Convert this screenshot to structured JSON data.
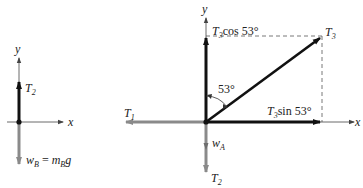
{
  "left_diagram": {
    "axis_x": "x",
    "axis_y": "y",
    "force_up": {
      "symbol": "T",
      "sub": "2"
    },
    "force_down": {
      "lhs": "w",
      "lhs_sub": "B",
      "eq": " = ",
      "rhs": "m",
      "rhs_sub": "B",
      "rhs_tail": "g"
    }
  },
  "right_diagram": {
    "axis_x": "x",
    "axis_y": "y",
    "angle_label": "53°",
    "t3": {
      "symbol": "T",
      "sub": "3"
    },
    "t1": {
      "symbol": "T",
      "sub": "1"
    },
    "t2": {
      "symbol": "T",
      "sub": "2"
    },
    "wa": {
      "symbol": "w",
      "sub": "A"
    },
    "t3_cos": {
      "symbol": "T",
      "sub": "3",
      "func": "cos 53°"
    },
    "t3_sin": {
      "symbol": "T",
      "sub": "3",
      "func": "sin 53°"
    }
  },
  "colors": {
    "dark": "#111111",
    "gray": "#8a8a8a",
    "dash": "#555555"
  }
}
